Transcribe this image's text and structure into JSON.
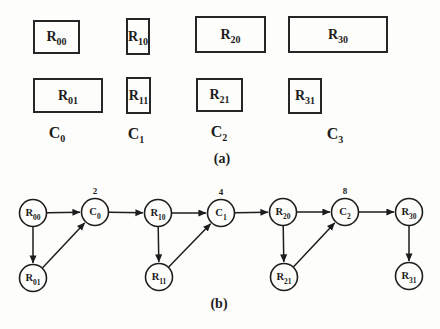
{
  "figure": {
    "caption_a": "(a)",
    "caption_b": "(b)",
    "ink_color": "#1d1d1d",
    "background_color": "#fdfdfb"
  },
  "figure_a": {
    "boxes": [
      {
        "id": "R00",
        "base": "R",
        "sub": "00",
        "x": 33,
        "y": 20,
        "w": 47,
        "h": 34
      },
      {
        "id": "R10",
        "base": "R",
        "sub": "10",
        "x": 126,
        "y": 18,
        "w": 24,
        "h": 37
      },
      {
        "id": "R20",
        "base": "R",
        "sub": "20",
        "x": 195,
        "y": 16,
        "w": 71,
        "h": 37
      },
      {
        "id": "R30",
        "base": "R",
        "sub": "30",
        "x": 288,
        "y": 16,
        "w": 100,
        "h": 37
      },
      {
        "id": "R01",
        "base": "R",
        "sub": "01",
        "x": 33,
        "y": 78,
        "w": 70,
        "h": 35
      },
      {
        "id": "R11",
        "base": "R",
        "sub": "11",
        "x": 126,
        "y": 77,
        "w": 25,
        "h": 37
      },
      {
        "id": "R21",
        "base": "R",
        "sub": "21",
        "x": 196,
        "y": 78,
        "w": 47,
        "h": 34
      },
      {
        "id": "R31",
        "base": "R",
        "sub": "31",
        "x": 288,
        "y": 78,
        "w": 34,
        "h": 36
      }
    ],
    "column_labels": [
      {
        "id": "C0",
        "base": "C",
        "sub": "0",
        "x": 57,
        "y": 125
      },
      {
        "id": "C1",
        "base": "C",
        "sub": "1",
        "x": 136,
        "y": 126
      },
      {
        "id": "C2",
        "base": "C",
        "sub": "2",
        "x": 219,
        "y": 124
      },
      {
        "id": "C3",
        "base": "C",
        "sub": "3",
        "x": 335,
        "y": 126
      }
    ],
    "caption_x": 222,
    "caption_y": 152
  },
  "figure_b": {
    "node_radius": 13.5,
    "nodes": [
      {
        "id": "R00",
        "base": "R",
        "sub": "00",
        "x": 33,
        "y": 213
      },
      {
        "id": "C0",
        "base": "C",
        "sub": "0",
        "x": 95,
        "y": 212,
        "annotation": "2"
      },
      {
        "id": "R10",
        "base": "R",
        "sub": "10",
        "x": 158,
        "y": 213
      },
      {
        "id": "C1",
        "base": "C",
        "sub": "1",
        "x": 221,
        "y": 213,
        "annotation": "4"
      },
      {
        "id": "R20",
        "base": "R",
        "sub": "20",
        "x": 283,
        "y": 212
      },
      {
        "id": "C2",
        "base": "C",
        "sub": "2",
        "x": 345,
        "y": 212,
        "annotation": "8"
      },
      {
        "id": "R30",
        "base": "R",
        "sub": "30",
        "x": 409,
        "y": 212
      },
      {
        "id": "R01",
        "base": "R",
        "sub": "01",
        "x": 33,
        "y": 278
      },
      {
        "id": "R11",
        "base": "R",
        "sub": "11",
        "x": 159,
        "y": 277
      },
      {
        "id": "R21",
        "base": "R",
        "sub": "21",
        "x": 284,
        "y": 277
      },
      {
        "id": "R31",
        "base": "R",
        "sub": "31",
        "x": 409,
        "y": 276
      }
    ],
    "edges": [
      {
        "from": "R00",
        "to": "C0"
      },
      {
        "from": "C0",
        "to": "R10"
      },
      {
        "from": "R10",
        "to": "C1"
      },
      {
        "from": "C1",
        "to": "R20"
      },
      {
        "from": "R20",
        "to": "C2"
      },
      {
        "from": "C2",
        "to": "R30"
      },
      {
        "from": "R00",
        "to": "R01"
      },
      {
        "from": "R01",
        "to": "C0"
      },
      {
        "from": "R10",
        "to": "R11"
      },
      {
        "from": "R11",
        "to": "C1"
      },
      {
        "from": "R20",
        "to": "R21"
      },
      {
        "from": "R21",
        "to": "C2"
      },
      {
        "from": "R30",
        "to": "R31"
      }
    ],
    "caption_x": 219,
    "caption_y": 297
  }
}
